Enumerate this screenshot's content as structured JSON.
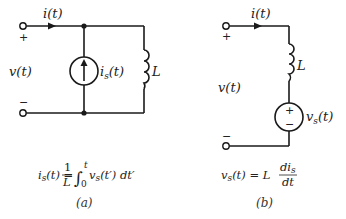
{
  "figure": {
    "panels": [
      {
        "id": "a",
        "caption": "(a)",
        "current_label": "i(t)",
        "voltage_label": "v(t)",
        "plus_sign": "+",
        "minus_sign": "−",
        "source_type": "current-source",
        "source_label_main": "i",
        "source_label_sub": "s",
        "source_label_arg": "(t)",
        "element_label": "L",
        "equation": {
          "lhs": "i",
          "lhs_sub": "s",
          "lhs_arg": "(t) =",
          "frac_num": "1",
          "frac_den": "L",
          "integral": "∫",
          "upper_limit": "t",
          "lower_limit": "0",
          "integrand": "v",
          "integrand_sub": "s",
          "integrand_arg": "(t′) dt′"
        }
      },
      {
        "id": "b",
        "caption": "(b)",
        "current_label": "i(t)",
        "voltage_label": "v(t)",
        "plus_sign": "+",
        "minus_sign": "−",
        "source_type": "voltage-source",
        "source_plus": "+",
        "source_minus": "−",
        "source_label_main": "v",
        "source_label_sub": "s",
        "source_label_arg": "(t)",
        "element_label": "L",
        "equation": {
          "lhs": "v",
          "lhs_sub": "s",
          "lhs_arg": "(t) = L",
          "frac_num": "di",
          "frac_num_sub": "s",
          "frac_den": "dt"
        }
      }
    ]
  }
}
